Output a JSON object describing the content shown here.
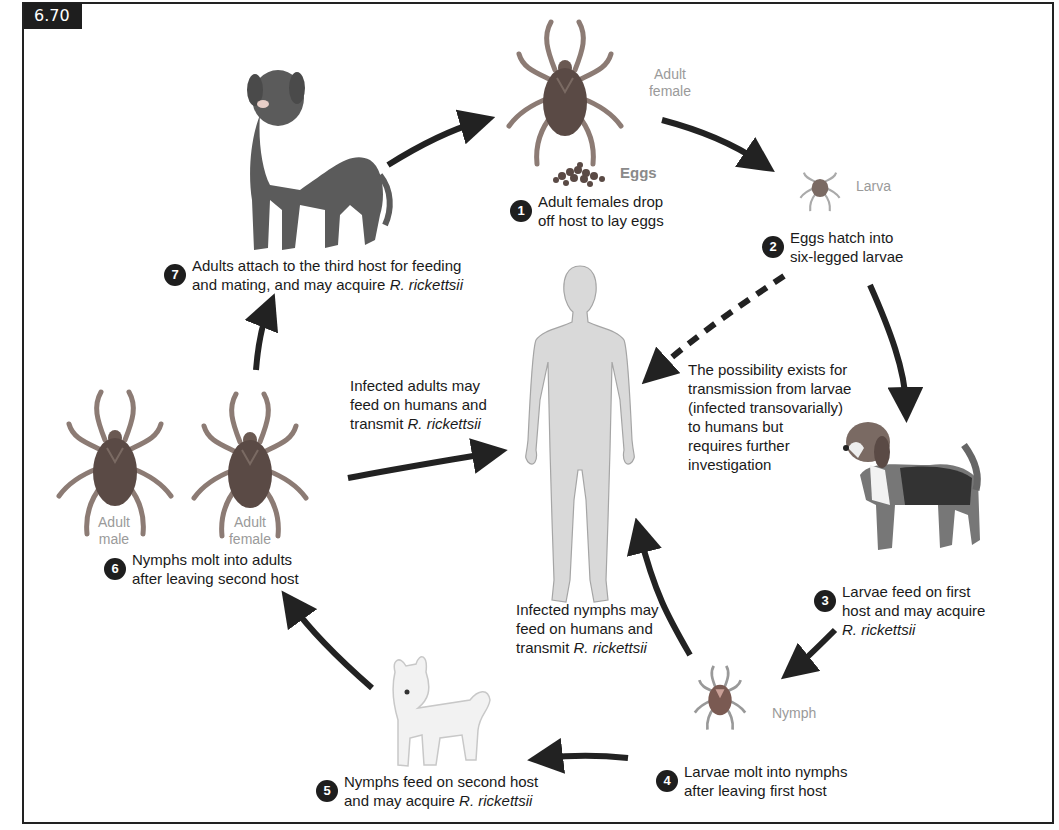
{
  "figure": {
    "number": "6.70"
  },
  "stage_labels": {
    "adult_female_top": [
      "Adult",
      "female"
    ],
    "eggs": "Eggs",
    "larva": "Larva",
    "nymph": "Nymph",
    "adult_male": [
      "Adult",
      "male"
    ],
    "adult_female_left": [
      "Adult",
      "female"
    ]
  },
  "steps": [
    {
      "number": "1",
      "lines": [
        "Adult females drop",
        "off host to lay eggs"
      ],
      "italic_suffix": ""
    },
    {
      "number": "2",
      "lines": [
        "Eggs hatch into",
        "six-legged larvae"
      ],
      "italic_suffix": ""
    },
    {
      "number": "3",
      "lines": [
        "Larvae feed on first",
        "host and may acquire"
      ],
      "italic_suffix": "R. rickettsii"
    },
    {
      "number": "4",
      "lines": [
        "Larvae molt into nymphs",
        "after leaving first host"
      ],
      "italic_suffix": ""
    },
    {
      "number": "5",
      "lines": [
        "Nymphs feed on second host",
        "and may acquire "
      ],
      "italic_suffix": "R. rickettsii"
    },
    {
      "number": "6",
      "lines": [
        "Nymphs molt into adults",
        "after leaving second host"
      ],
      "italic_suffix": ""
    },
    {
      "number": "7",
      "lines": [
        "Adults attach to the third host for feeding",
        "and mating, and may acquire "
      ],
      "italic_suffix": "R. rickettsii"
    }
  ],
  "annotations": {
    "larvae_to_humans": [
      "The possibility exists for",
      "transmission from larvae",
      "(infected transovarially)",
      "to humans but",
      "requires further",
      "investigation"
    ],
    "adults_to_humans": {
      "lines": [
        "Infected adults may",
        "feed on humans and",
        "transmit "
      ],
      "italic_suffix": "R. rickettsii"
    },
    "nymphs_to_humans": {
      "lines": [
        "Infected nymphs may",
        "feed on humans and",
        "transmit "
      ],
      "italic_suffix": "R. rickettsii"
    }
  },
  "hosts": {
    "first": "beagle",
    "second": "small white terrier",
    "third": "large dog",
    "human": "human silhouette"
  },
  "colors": {
    "arrow": "#222222",
    "tick_body": "#5a4a45",
    "tick_leg": "#8c7b74",
    "big_dog": "#5b5b5b",
    "human": "#d9d9d9",
    "label_gray": "#9a9a9a",
    "badge": "#1e1e1e"
  }
}
